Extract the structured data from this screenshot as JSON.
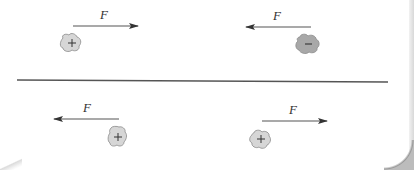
{
  "diagram": {
    "divider": {
      "x1": 17,
      "y1": 80,
      "x2": 388,
      "y2": 82,
      "color": "#555555"
    },
    "panels": [
      {
        "name": "top-left",
        "force_label": "F",
        "arrow_direction": "right",
        "charge_sign": "+",
        "charge_color": "#d6d6d6"
      },
      {
        "name": "top-right",
        "force_label": "F",
        "arrow_direction": "left",
        "charge_sign": "−",
        "charge_color": "#a8a8a8"
      },
      {
        "name": "bottom-left",
        "force_label": "F",
        "arrow_direction": "left",
        "charge_sign": "+",
        "charge_color": "#d6d6d6"
      },
      {
        "name": "bottom-right",
        "force_label": "F",
        "arrow_direction": "right",
        "charge_sign": "+",
        "charge_color": "#d6d6d6"
      }
    ]
  }
}
